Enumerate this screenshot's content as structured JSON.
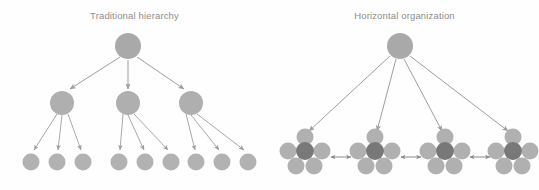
{
  "figure": {
    "background_color": "#fefefe",
    "title_color": "#8d8d8d"
  },
  "colors": {
    "node_root": "#a9a9a9",
    "node_mid": "#afafaf",
    "node_leaf": "#b2b2b2",
    "node_cluster_outer": "#b0b0b0",
    "node_cluster_center": "#787878",
    "arrow": "#9e9e9e",
    "arrow_bidirectional": "#8a8a8a"
  },
  "panels": [
    {
      "id": "traditional-hierarchy",
      "title": "Traditional hierarchy",
      "type": "tree",
      "levels": [
        {
          "name": "root",
          "count": 1,
          "radius": 13,
          "y": 46,
          "x": [
            128
          ]
        },
        {
          "name": "middle",
          "count": 3,
          "radius": 12,
          "y": 103,
          "x": [
            62,
            128,
            191
          ]
        },
        {
          "name": "leaf",
          "count": 9,
          "radius": 8.5,
          "y": 162,
          "x": [
            31,
            57,
            83,
            119,
            145,
            171,
            196,
            222,
            248
          ]
        }
      ],
      "edges_root_to_middle": 3,
      "edges_middle_to_leaf": 9
    },
    {
      "id": "horizontal-organization",
      "title": "Horizontal organization",
      "type": "cluster-network",
      "root": {
        "radius": 13,
        "x": 400,
        "y": 46
      },
      "cluster_count": 4,
      "cluster_centers_x": [
        305,
        375,
        445,
        513
      ],
      "cluster_center_y": 151,
      "cluster_node_radius_outer": 8.5,
      "cluster_node_radius_center": 9,
      "cluster_layout": [
        {
          "role": "top",
          "dx": 0,
          "dy": -14,
          "shade": "outer"
        },
        {
          "role": "middle-left",
          "dx": -17,
          "dy": 0,
          "shade": "outer"
        },
        {
          "role": "center",
          "dx": 0,
          "dy": 0,
          "shade": "center"
        },
        {
          "role": "middle-right",
          "dx": 17,
          "dy": 0,
          "shade": "outer"
        },
        {
          "role": "bottom-left",
          "dx": -9,
          "dy": 15,
          "shade": "outer"
        },
        {
          "role": "bottom-right",
          "dx": 9,
          "dy": 15,
          "shade": "outer"
        }
      ],
      "arrows_root_to_cluster": 4,
      "bidirectional_link_count": 3,
      "bidirectional_links_y": 156,
      "bidirectional_links_x": [
        {
          "from": 330,
          "to": 352
        },
        {
          "from": 400,
          "to": 422
        },
        {
          "from": 470,
          "to": 492
        }
      ]
    }
  ]
}
